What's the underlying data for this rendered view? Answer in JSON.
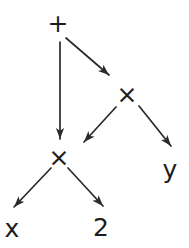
{
  "diagram": {
    "kind": "expression-dag",
    "background_color": "#ffffff",
    "stroke_color": "#2a2a2a",
    "text_color": "#1c1c1c",
    "nodes": [
      {
        "id": "plus",
        "label": "+",
        "x": 58,
        "y": 23
      },
      {
        "id": "times-upper",
        "label": "×",
        "x": 127,
        "y": 94
      },
      {
        "id": "times-lower",
        "label": "×",
        "x": 59,
        "y": 157
      },
      {
        "id": "y",
        "label": "y",
        "x": 170,
        "y": 169
      },
      {
        "id": "x",
        "label": "x",
        "x": 12,
        "y": 228
      },
      {
        "id": "two",
        "label": "2",
        "x": 101,
        "y": 227
      }
    ],
    "edges": [
      {
        "from": "plus",
        "to": "times-lower",
        "x1": 60,
        "y1": 42,
        "x2": 60,
        "y2": 139
      },
      {
        "from": "plus",
        "to": "times-upper",
        "x1": 66,
        "y1": 38,
        "x2": 109,
        "y2": 75
      },
      {
        "from": "times-upper",
        "to": "times-lower",
        "x1": 116,
        "y1": 107,
        "x2": 84,
        "y2": 142
      },
      {
        "from": "times-upper",
        "to": "y",
        "x1": 139,
        "y1": 106,
        "x2": 171,
        "y2": 146
      },
      {
        "from": "times-lower",
        "to": "x",
        "x1": 51,
        "y1": 168,
        "x2": 14,
        "y2": 207
      },
      {
        "from": "times-lower",
        "to": "two",
        "x1": 68,
        "y1": 168,
        "x2": 103,
        "y2": 206
      }
    ]
  }
}
